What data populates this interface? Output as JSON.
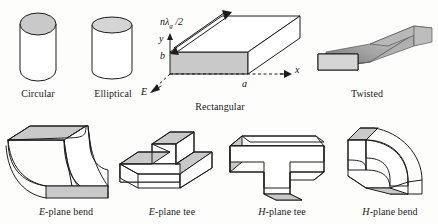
{
  "figure": {
    "background_color": "#fdfdfc",
    "line_color": "#1c1c1c",
    "shade_color": "#c9c9c9"
  },
  "items": [
    {
      "id": "circular",
      "caption_prefix": "",
      "caption": "Circular"
    },
    {
      "id": "elliptical",
      "caption_prefix": "",
      "caption": "Elliptical"
    },
    {
      "id": "rectangular",
      "caption_prefix": "",
      "caption": "Rectangular"
    },
    {
      "id": "twisted",
      "caption_prefix": "",
      "caption": "Twisted"
    },
    {
      "id": "e-plane-bend",
      "caption_prefix": "E",
      "caption": "-plane bend"
    },
    {
      "id": "e-plane-tee",
      "caption_prefix": "E",
      "caption": "-plane tee"
    },
    {
      "id": "h-plane-tee",
      "caption_prefix": "H",
      "caption": "-plane tee"
    },
    {
      "id": "h-plane-bend",
      "caption_prefix": "H",
      "caption": "-plane bend"
    }
  ],
  "annotations": {
    "length_label_main": "nλ",
    "length_label_sub": "g",
    "length_label_tail": " /2",
    "axis_y": "y",
    "axis_x": "x",
    "dim_b": "b",
    "dim_a": "a",
    "field_e": "E"
  }
}
